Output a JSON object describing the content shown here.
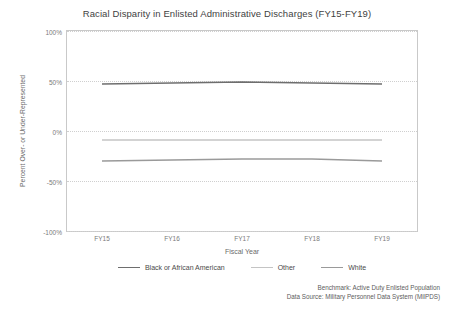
{
  "chart_data": {
    "type": "line",
    "title": "Racial Disparity in Enlisted Administrative Discharges (FY15-FY19)",
    "xlabel": "Fiscal Year",
    "ylabel": "Percent Over- or Under-Represented",
    "categories": [
      "FY15",
      "FY16",
      "FY17",
      "FY18",
      "FY19"
    ],
    "ylim": [
      -100,
      100
    ],
    "yticks": [
      100,
      50,
      0,
      -50,
      -100
    ],
    "ytick_labels": [
      "100%",
      "50%",
      "0%",
      "-50%",
      "-100%"
    ],
    "grid": true,
    "legend_position": "bottom",
    "series": [
      {
        "name": "Black or African American",
        "color": "#6e6e6e",
        "values": [
          47,
          48,
          49,
          48,
          47
        ]
      },
      {
        "name": "Other",
        "color": "#c4c4c4",
        "values": [
          -9,
          -9,
          -9,
          -9,
          -9
        ]
      },
      {
        "name": "White",
        "color": "#9a9a9a",
        "values": [
          -30,
          -29,
          -28,
          -28,
          -30
        ]
      }
    ],
    "annotations": [
      "Benchmark: Active Duty Enlisted Population",
      "Data Source: Military Personnel Data System (MilPDS)"
    ]
  }
}
